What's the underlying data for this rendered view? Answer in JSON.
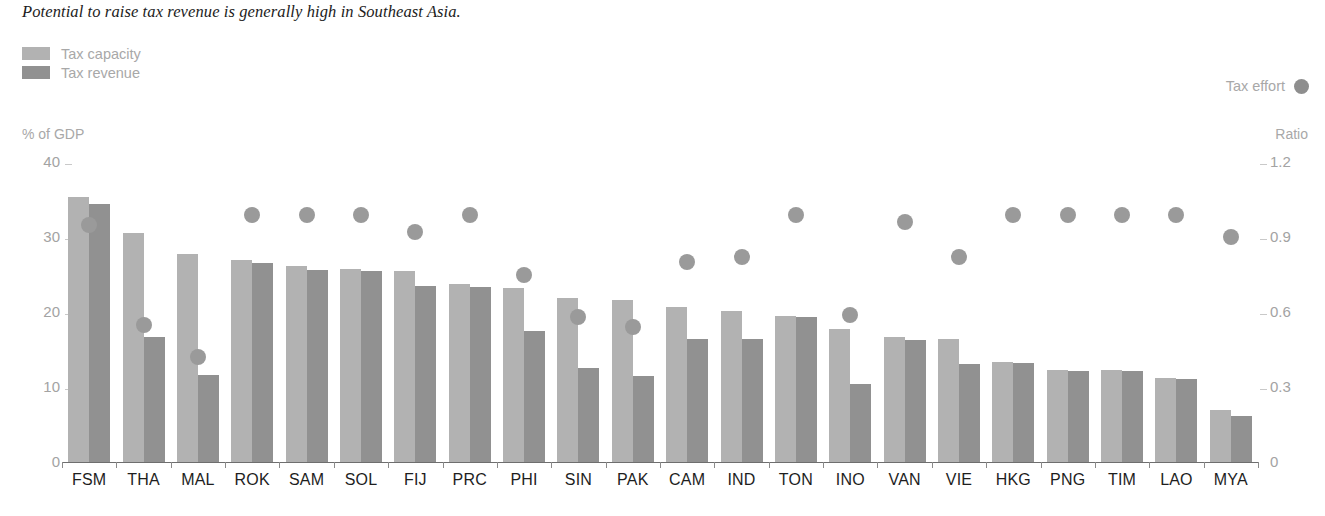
{
  "caption": "Potential to raise tax revenue is generally high in Southeast Asia.",
  "legend": {
    "items": [
      {
        "label": "Tax capacity",
        "color": "#b2b2b2",
        "icon": "square-swatch-icon"
      },
      {
        "label": "Tax revenue",
        "color": "#919191",
        "icon": "square-swatch-icon"
      }
    ],
    "effort": {
      "label": "Tax effort",
      "color": "#9a9a9a",
      "icon": "circle-swatch-icon"
    }
  },
  "axes": {
    "left_unit": "% of GDP",
    "right_unit": "Ratio",
    "left_ticks": [
      "40",
      "30",
      "20",
      "10",
      "0"
    ],
    "right_ticks": [
      "1.2",
      "0.9",
      "0.6",
      "0.3",
      "0"
    ]
  },
  "chart_data": {
    "type": "bar",
    "title": "Potential to raise tax revenue is generally high in Southeast Asia.",
    "xlabel": "",
    "ylabel": "% of GDP",
    "y2label": "Ratio",
    "ylim": [
      0,
      40
    ],
    "y2lim": [
      0,
      1.2
    ],
    "grid": false,
    "legend_position": "top-left",
    "categories": [
      "FSM",
      "THA",
      "MAL",
      "ROK",
      "SAM",
      "SOL",
      "FIJ",
      "PRC",
      "PHI",
      "SIN",
      "PAK",
      "CAM",
      "IND",
      "TON",
      "INO",
      "VAN",
      "VIE",
      "HKG",
      "PNG",
      "TIM",
      "LAO",
      "MYA"
    ],
    "series": [
      {
        "name": "Tax capacity",
        "axis": "left",
        "color": "#b2b2b2",
        "values": [
          35.3,
          30.5,
          27.7,
          26.9,
          26.1,
          25.8,
          25.5,
          23.8,
          23.2,
          21.9,
          21.6,
          20.7,
          20.1,
          19.5,
          17.8,
          16.7,
          16.4,
          13.3,
          12.3,
          12.3,
          11.2,
          6.9
        ]
      },
      {
        "name": "Tax revenue",
        "axis": "left",
        "color": "#919191",
        "values": [
          34.4,
          16.7,
          11.6,
          26.6,
          25.6,
          25.5,
          23.5,
          23.4,
          17.5,
          12.5,
          11.5,
          16.4,
          16.4,
          19.3,
          10.4,
          16.3,
          13.1,
          13.2,
          12.2,
          12.1,
          11.1,
          6.1
        ]
      },
      {
        "name": "Tax effort",
        "axis": "right",
        "color": "#9a9a9a",
        "type": "scatter",
        "values": [
          0.95,
          0.55,
          0.42,
          0.99,
          0.99,
          0.99,
          0.92,
          0.99,
          0.75,
          0.58,
          0.54,
          0.8,
          0.82,
          0.99,
          0.59,
          0.96,
          0.82,
          0.99,
          0.99,
          0.99,
          0.99,
          0.9
        ]
      }
    ]
  },
  "source_note": ""
}
